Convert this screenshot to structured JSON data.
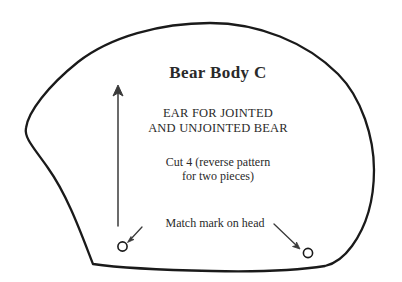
{
  "document": {
    "kind": "sewing-pattern-piece",
    "title": "Bear Body C",
    "usage_line_1": "EAR FOR JOINTED",
    "usage_line_2": "AND UNJOINTED BEAR",
    "cut_line_1": "Cut 4 (reverse pattern",
    "cut_line_2": "for two pieces)",
    "match_mark_label": "Match mark on head"
  },
  "colors": {
    "ink": "#1a1a1a",
    "text": "#2a2a2a",
    "paper": "#ffffff"
  },
  "graphics": {
    "outline_name": "pattern-piece-outline",
    "grainline_name": "grainline-arrow",
    "match_mark_left_name": "match-mark-circle-left",
    "match_mark_right_name": "match-mark-circle-right",
    "leader_left_name": "leader-arrow-left",
    "leader_right_name": "leader-arrow-right"
  }
}
